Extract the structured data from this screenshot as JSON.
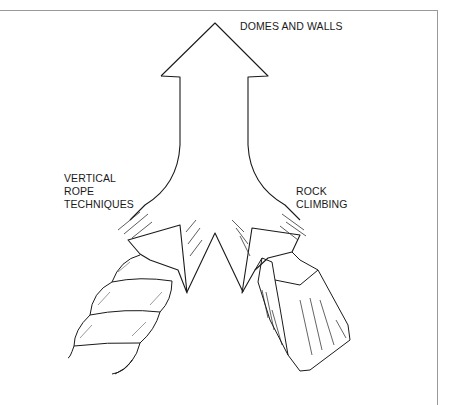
{
  "diagram": {
    "type": "converging-arrow",
    "labels": {
      "top": "DOMES AND WALLS",
      "left_line1": "VERTICAL",
      "left_line2": "ROPE",
      "left_line3": "TECHNIQUES",
      "right_line1": "ROCK",
      "right_line2": "CLIMBING"
    },
    "illustrations": {
      "left": "twisted-rope",
      "right": "rock-fragment"
    },
    "colors": {
      "ink": "#1a1a1a",
      "frame": "#9a9a9a",
      "background": "#ffffff"
    }
  }
}
